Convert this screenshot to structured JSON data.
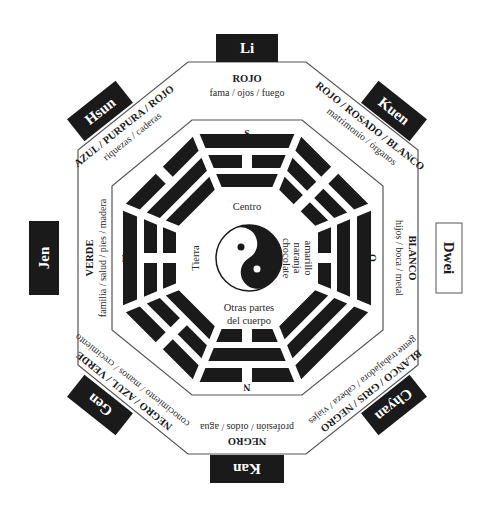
{
  "diagram": {
    "center": {
      "top_label": "Centro",
      "bottom_label_line1": "Otras partes",
      "bottom_label_line2": "del cuerpo",
      "left_label": "Tierra",
      "right_label_line1": "amarillo",
      "right_label_line2": "naranja",
      "right_label_line3": "chocolate",
      "symbol": "yin-yang-icon"
    },
    "directions": {
      "top": "S",
      "right": "O",
      "bottom": "N",
      "left": "E"
    },
    "sectors": [
      {
        "position": "top",
        "name": "Li",
        "colors": "ROJO",
        "associations": "fama / ojos / fuego",
        "trigram_outer_to_inner": [
          "solid",
          "broken",
          "solid"
        ],
        "name_box_style": "dark"
      },
      {
        "position": "top-right",
        "name": "Kuen",
        "colors": "ROJO / ROSADO / BLANCO",
        "associations": "matrimonio / órganos",
        "trigram_outer_to_inner": [
          "broken",
          "broken",
          "broken"
        ],
        "name_box_style": "dark"
      },
      {
        "position": "right",
        "name": "Dwei",
        "colors": "BLANCO",
        "associations": "hijos / boca / metal",
        "trigram_outer_to_inner": [
          "solid",
          "solid",
          "broken"
        ],
        "name_box_style": "light"
      },
      {
        "position": "bottom-right",
        "name": "Chyan",
        "colors": "BLANCO / GRIS / NEGRO",
        "associations": "gente trabajadora / cabeza / viajes",
        "trigram_outer_to_inner": [
          "solid",
          "solid",
          "solid"
        ],
        "name_box_style": "dark"
      },
      {
        "position": "bottom",
        "name": "Kan",
        "colors": "NEGRO",
        "associations": "profesión / oídos / agua",
        "trigram_outer_to_inner": [
          "broken",
          "solid",
          "broken"
        ],
        "name_box_style": "dark"
      },
      {
        "position": "bottom-left",
        "name": "Gen",
        "colors": "NEGRO / AZUL / VERDE",
        "associations": "conocimiento / manos / crecimiento",
        "trigram_outer_to_inner": [
          "broken",
          "broken",
          "solid"
        ],
        "name_box_style": "dark"
      },
      {
        "position": "left",
        "name": "Jen",
        "colors": "VERDE",
        "associations": "familia / salud / pies / madera",
        "trigram_outer_to_inner": [
          "solid",
          "broken",
          "broken"
        ],
        "name_box_style": "dark"
      },
      {
        "position": "top-left",
        "name": "Hsun",
        "colors": "AZUL / PURPURA / ROJO",
        "associations": "riquezas / caderas",
        "trigram_outer_to_inner": [
          "broken",
          "solid",
          "solid"
        ],
        "name_box_style": "dark"
      }
    ],
    "palette": {
      "ink": "#1a1a1a",
      "paper": "#ffffff",
      "line": "#555555"
    }
  }
}
